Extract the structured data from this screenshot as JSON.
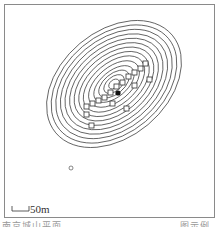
{
  "figure": {
    "type": "topographic contour map",
    "scale_bar": {
      "label": "50m"
    },
    "caption_left": "南京城山平面",
    "caption_right": "图示例",
    "colors": {
      "line": "#333333",
      "frame": "#8a8a8a",
      "background": "#ffffff"
    },
    "contours": {
      "count": 14,
      "orientation_deg": -40,
      "center": [
        118,
        79
      ]
    },
    "features": [
      {
        "name": "summit-point",
        "shape": "filled-dot"
      },
      {
        "name": "structures",
        "shape": "small-squares",
        "count": 16
      },
      {
        "name": "isolated-ring",
        "shape": "small-circle"
      }
    ]
  }
}
